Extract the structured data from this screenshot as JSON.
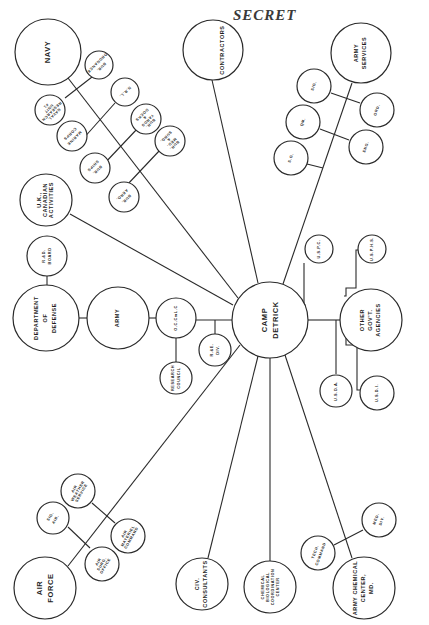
{
  "stamp": {
    "text": "SECRET"
  },
  "center": {
    "label_line1": "CAMP",
    "label_line2": "DETRICK"
  },
  "nodes": {
    "navy": {
      "lines": [
        "NAVY"
      ]
    },
    "bur_ordnance": {
      "lines": [
        "BUR.",
        "ORDNANCE"
      ]
    },
    "nrl": {
      "lines": [
        "N.R.L."
      ]
    },
    "naval_research_unit": {
      "lines": [
        "NAVAL",
        "RESEARCH",
        "UNIT",
        "#1"
      ]
    },
    "marine_corps": {
      "lines": [
        "MARINE",
        "CORPS"
      ]
    },
    "bur_yards_docks": {
      "lines": [
        "BUR.",
        "YARDS",
        "&",
        "DOCKS"
      ]
    },
    "bur_ships": {
      "lines": [
        "BUR.",
        "SHIPS"
      ]
    },
    "bur_med_surg": {
      "lines": [
        "BUR.",
        "MED.",
        "&",
        "SURG."
      ]
    },
    "bur_aero": {
      "lines": [
        "BUR.",
        "AERO."
      ]
    },
    "contractors": {
      "lines": [
        "CONTRACTORS"
      ]
    },
    "army_services": {
      "lines": [
        "ARMY",
        "SERVICES"
      ]
    },
    "sig": {
      "lines": [
        "SIG."
      ]
    },
    "qm": {
      "lines": [
        "QM."
      ]
    },
    "sg": {
      "lines": [
        "S.G."
      ]
    },
    "ord": {
      "lines": [
        "ORD."
      ]
    },
    "eng": {
      "lines": [
        "ENG."
      ]
    },
    "uk_canadian": {
      "lines": [
        "U.K.,",
        "CANADIAN",
        "ACTIVITIES"
      ]
    },
    "rd_board": {
      "lines": [
        "R.&D.",
        "BOARD"
      ]
    },
    "dept_defense": {
      "lines": [
        "DEPARTMENT",
        "OF",
        "DEFENSE"
      ]
    },
    "army": {
      "lines": [
        "ARMY"
      ]
    },
    "oc_cmlc": {
      "lines": [
        "O.C.CmL.C"
      ]
    },
    "re_div": {
      "lines": [
        "R.&E.",
        "DIV."
      ]
    },
    "research_council": {
      "lines": [
        "RESEARCH",
        "COUNCIL"
      ]
    },
    "other_govt": {
      "lines": [
        "OTHER",
        "GOV'T.",
        "AGENCIES"
      ]
    },
    "uspc": {
      "lines": [
        "U.S.P.C."
      ]
    },
    "usphs": {
      "lines": [
        "U.S.P.H.S."
      ]
    },
    "usda": {
      "lines": [
        "U.S.D.A."
      ]
    },
    "usdi": {
      "lines": [
        "U.S.D.I."
      ]
    },
    "air_force": {
      "lines": [
        "AIR",
        "FORCE"
      ]
    },
    "sig_air": {
      "lines": [
        "SIG.",
        "AIR."
      ]
    },
    "air_weather": {
      "lines": [
        "AIR",
        "WEATHER",
        "SERVICE"
      ]
    },
    "air_surg_office": {
      "lines": [
        "AIR",
        "SURG.",
        "OFFICE"
      ]
    },
    "air_materiel": {
      "lines": [
        "AIR",
        "MATERIEL",
        "COMMAND"
      ]
    },
    "civ_consultants": {
      "lines": [
        "CIV.",
        "CONSULTANTS"
      ]
    },
    "chem_bio_center": {
      "lines": [
        "CHEMICAL",
        "BIOLOGICAL",
        "COORDINATION",
        "CENTER"
      ]
    },
    "army_chem_center": {
      "lines": [
        "ARMY CHEMICAL",
        "CENTER,",
        "MD."
      ]
    },
    "tech_command": {
      "lines": [
        "TECH.",
        "COMMAND"
      ]
    },
    "med_div": {
      "lines": [
        "MED.",
        "DIV."
      ]
    }
  }
}
